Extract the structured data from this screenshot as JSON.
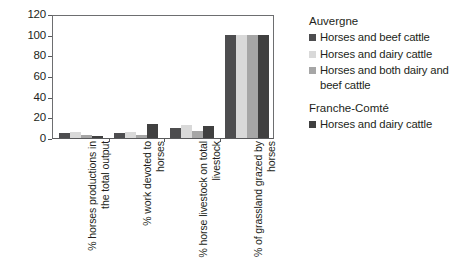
{
  "chart_data": {
    "type": "bar",
    "title": "",
    "subtitle": "",
    "xlabel": "",
    "ylabel": "",
    "ylim": [
      0,
      120
    ],
    "yticks": [
      0,
      20,
      40,
      60,
      80,
      100,
      120
    ],
    "ytick_labels": [
      "0",
      "20",
      "40",
      "60",
      "80",
      "100",
      "120"
    ],
    "grid": false,
    "legend_position": "right",
    "categories": [
      "% horses productions in the total output",
      "% work devoted to horses",
      "% horse livestock on total livestock",
      "% of grassland grazed by horses"
    ],
    "series": [
      {
        "name": "Horses and beef cattle",
        "group": "Auvergne",
        "color": "#4d4d4f",
        "values": [
          5,
          5,
          10,
          100
        ]
      },
      {
        "name": "Horses and dairy cattle",
        "group": "Auvergne",
        "color": "#d9d9d9",
        "values": [
          6,
          6,
          13,
          100
        ]
      },
      {
        "name": "Horses and both dairy and beef cattle",
        "group": "Auvergne",
        "color": "#a6a6a6",
        "values": [
          3,
          3,
          7,
          100
        ]
      },
      {
        "name": "Horses and dairy cattle",
        "group": "Franche-Comté",
        "color": "#404040",
        "values": [
          2,
          14,
          12,
          100
        ]
      }
    ]
  },
  "legend": {
    "groups": [
      {
        "title": "Auvergne",
        "entries": [
          {
            "label": "Horses and beef cattle",
            "color": "#4d4d4f"
          },
          {
            "label": "Horses and dairy cattle",
            "color": "#d9d9d9"
          },
          {
            "label": "Horses and both dairy and beef cattle",
            "color": "#a6a6a6"
          }
        ]
      },
      {
        "title": "Franche-Comté",
        "entries": [
          {
            "label": "Horses and dairy cattle",
            "color": "#404040"
          }
        ]
      }
    ]
  },
  "axis": {
    "frame_color": "#6d6e70",
    "tick_color": "#58595b"
  }
}
